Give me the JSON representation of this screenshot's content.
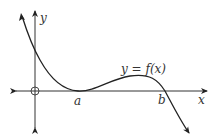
{
  "diagram": {
    "type": "function-graph",
    "labels": {
      "y_axis": "y",
      "x_axis": "x",
      "root_a": "a",
      "root_b": "b",
      "function": "y = f(x)"
    },
    "colors": {
      "curve": "#222222",
      "axes": "#333333",
      "background": "#ffffff"
    }
  }
}
